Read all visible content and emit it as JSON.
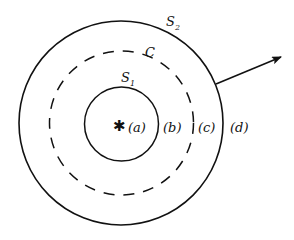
{
  "diagram": {
    "colors": {
      "stroke": "#111111",
      "background": "#ffffff"
    },
    "outer_surface": {
      "label": "S",
      "subscript": "2",
      "style": "solid"
    },
    "curve": {
      "label": "C",
      "style": "dashed"
    },
    "inner_surface": {
      "label": "S",
      "subscript": "1",
      "style": "solid"
    },
    "source_symbol": "✱",
    "regions": [
      {
        "id": "a",
        "label": "(a)"
      },
      {
        "id": "b",
        "label": "(b)"
      },
      {
        "id": "c",
        "label": "(c)"
      },
      {
        "id": "d",
        "label": "(d)"
      }
    ],
    "arrow": {
      "direction": "outward, upper-right"
    }
  }
}
